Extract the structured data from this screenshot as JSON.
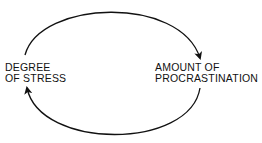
{
  "diagram": {
    "type": "cycle",
    "nodes": [
      {
        "id": "stress",
        "lines": [
          "DEGREE",
          "OF STRESS"
        ]
      },
      {
        "id": "procrastination",
        "lines": [
          "AMOUNT OF",
          "PROCRASTINATION"
        ]
      }
    ],
    "edges": [
      {
        "from": "stress",
        "to": "procrastination",
        "path": "top-arc"
      },
      {
        "from": "procrastination",
        "to": "stress",
        "path": "bottom-arc"
      }
    ],
    "stroke_color": "#111111"
  }
}
